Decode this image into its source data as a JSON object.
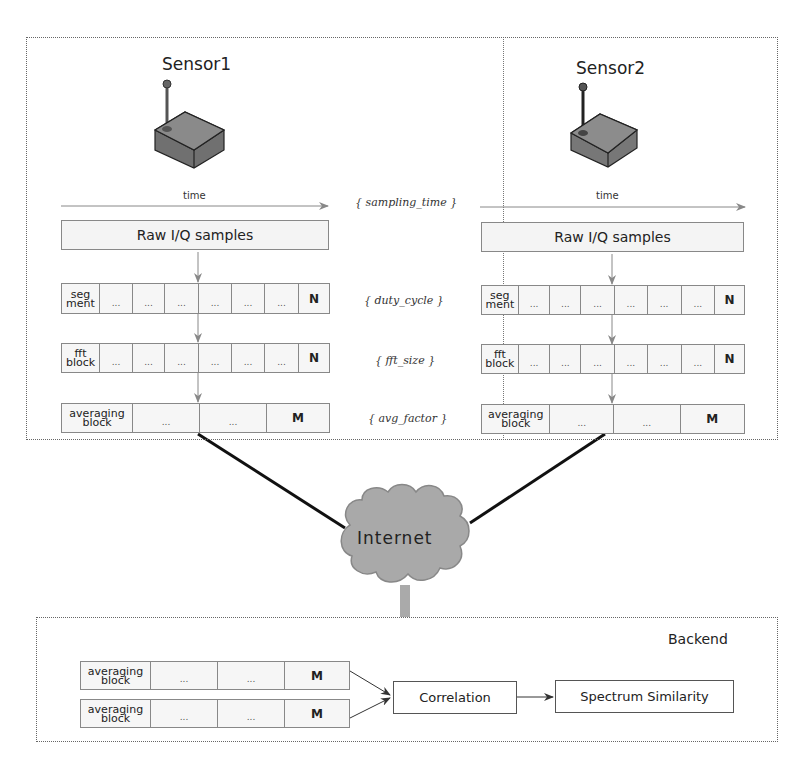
{
  "sensors": [
    {
      "title": "Sensor1",
      "time_label": "time",
      "raw_label": "Raw I/Q samples",
      "segment_row": {
        "head": [
          "seg",
          "ment"
        ],
        "cells": [
          "...",
          "...",
          "...",
          "...",
          "...",
          "..."
        ],
        "end": "N"
      },
      "fft_row": {
        "head": [
          "fft",
          "block"
        ],
        "cells": [
          "...",
          "...",
          "...",
          "...",
          "...",
          "..."
        ],
        "end": "N"
      },
      "avg_row": {
        "head": [
          "averaging",
          "block"
        ],
        "cells": [
          "...",
          "..."
        ],
        "end": "M"
      }
    },
    {
      "title": "Sensor2",
      "time_label": "time",
      "raw_label": "Raw I/Q samples",
      "segment_row": {
        "head": [
          "seg",
          "ment"
        ],
        "cells": [
          "...",
          "...",
          "...",
          "...",
          "...",
          "..."
        ],
        "end": "N"
      },
      "fft_row": {
        "head": [
          "fft",
          "block"
        ],
        "cells": [
          "...",
          "...",
          "...",
          "...",
          "...",
          "..."
        ],
        "end": "N"
      },
      "avg_row": {
        "head": [
          "averaging",
          "block"
        ],
        "cells": [
          "...",
          "..."
        ],
        "end": "M"
      }
    }
  ],
  "parameters": {
    "sampling_time": "{ sampling_time }",
    "duty_cycle": "{ duty_cycle }",
    "fft_size": "{ fft_size }",
    "avg_factor": "{ avg_factor }"
  },
  "network": {
    "label": "Internet"
  },
  "backend": {
    "title": "Backend",
    "inputs": [
      {
        "head": [
          "averaging",
          "block"
        ],
        "cells": [
          "...",
          "..."
        ],
        "end": "M"
      },
      {
        "head": [
          "averaging",
          "block"
        ],
        "cells": [
          "...",
          "..."
        ],
        "end": "M"
      }
    ],
    "correlation_label": "Correlation",
    "similarity_label": "Spectrum Similarity"
  },
  "colors": {
    "frame": "#666666",
    "box_border": "#888888",
    "box_fill": "#f4f4f4",
    "sensor_body": "#7a7a7a",
    "cloud": "#a9a9a9",
    "link": "#111111"
  }
}
